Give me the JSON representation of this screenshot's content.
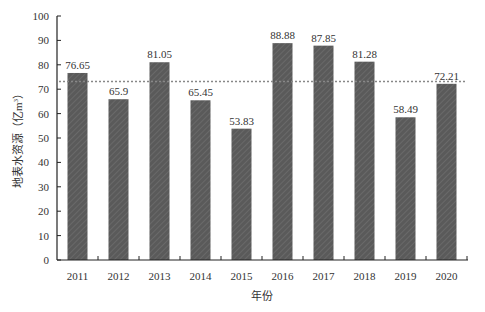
{
  "chart_data": {
    "type": "bar",
    "title": "",
    "xlabel": "年份",
    "ylabel": "地表水资源（亿m³）",
    "ylabel_main": "地表水资源（亿m",
    "ylabel_sup": "3",
    "ylabel_close": "）",
    "categories": [
      "2011",
      "2012",
      "2013",
      "2014",
      "2015",
      "2016",
      "2017",
      "2018",
      "2019",
      "2020"
    ],
    "values": [
      76.65,
      65.9,
      81.05,
      65.45,
      53.83,
      88.88,
      87.85,
      81.28,
      58.49,
      72.21
    ],
    "value_labels": [
      "76.65",
      "65.9",
      "81.05",
      "65.45",
      "53.83",
      "88.88",
      "87.85",
      "81.28",
      "58.49",
      "72.21"
    ],
    "ylim": [
      0,
      100
    ],
    "yticks": [
      0,
      10,
      20,
      30,
      40,
      50,
      60,
      70,
      80,
      90,
      100
    ],
    "reference_line": {
      "value": 73.16,
      "style": "dotted",
      "label": "mean"
    },
    "grid": false,
    "legend": null,
    "colors": {
      "bar": "#5a5a5a",
      "hatch": "#7a7a7a",
      "axis": "#222222",
      "reference": "#888888"
    }
  }
}
